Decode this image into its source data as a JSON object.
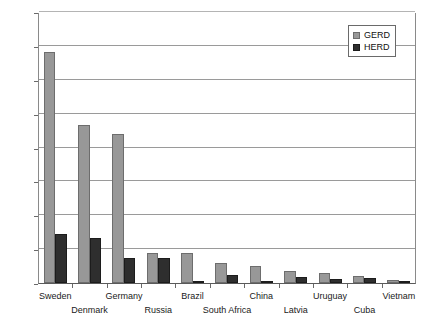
{
  "chart_data": {
    "type": "bar",
    "title": "",
    "subtitle": "",
    "xlabel": "",
    "ylabel": "",
    "ylim": [
      0,
      1600
    ],
    "ytick_step": 200,
    "yticks": [
      0,
      200,
      400,
      600,
      800,
      1000,
      1200,
      1400,
      1600
    ],
    "grid": "horizontal",
    "legend_position": "top-right",
    "categories": [
      "Sweden",
      "Denmark",
      "Germany",
      "Russia",
      "Brazil",
      "South Africa",
      "China",
      "Latvia",
      "Uruguay",
      "Cuba",
      "Vietnam"
    ],
    "series": [
      {
        "name": "GERD",
        "color": "#989898",
        "values": [
          1365,
          935,
          880,
          175,
          175,
          118,
          100,
          72,
          58,
          40,
          15
        ]
      },
      {
        "name": "HERD",
        "color": "#2e2e2e",
        "values": [
          290,
          265,
          150,
          150,
          12,
          45,
          8,
          35,
          22,
          28,
          8
        ]
      }
    ]
  },
  "legend": {
    "entries": [
      {
        "label": "GERD"
      },
      {
        "label": "HERD"
      }
    ]
  },
  "colors": {
    "gerd": "#989898",
    "herd": "#2e2e2e",
    "gridline": "#9a9a9a",
    "axis": "#5a5a5a",
    "text": "#1a1a1a",
    "background": "#ffffff"
  }
}
